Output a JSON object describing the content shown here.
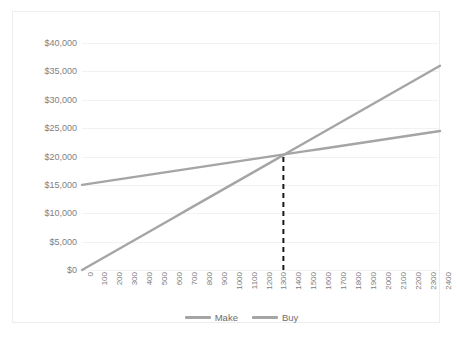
{
  "chart_data": {
    "type": "line",
    "title": "",
    "xlabel": "",
    "ylabel": "",
    "x": [
      0,
      100,
      200,
      300,
      400,
      500,
      600,
      700,
      800,
      900,
      1000,
      1100,
      1200,
      1300,
      1400,
      1500,
      1600,
      1700,
      1800,
      1900,
      2000,
      2100,
      2200,
      2300,
      2400
    ],
    "xtick_labels": [
      "0",
      "100",
      "200",
      "300",
      "400",
      "500",
      "600",
      "700",
      "800",
      "900",
      "1000",
      "1100",
      "1200",
      "1300",
      "1400",
      "1500",
      "1600",
      "1700",
      "1800",
      "1900",
      "2000",
      "2100",
      "2200",
      "2300",
      "2400"
    ],
    "ytick_labels": [
      "$0",
      "$5,000",
      "$10,000",
      "$15,000",
      "$20,000",
      "$25,000",
      "$30,000",
      "$35,000",
      "$40,000"
    ],
    "ytick_values": [
      0,
      5000,
      10000,
      15000,
      20000,
      25000,
      30000,
      35000,
      40000
    ],
    "xlim": [
      0,
      2400
    ],
    "ylim": [
      0,
      40000
    ],
    "grid": true,
    "legend_position": "bottom-center",
    "series": [
      {
        "name": "Make",
        "color": "#a5a5a5",
        "values": [
          0,
          1500,
          3000,
          4500,
          6000,
          7500,
          9000,
          10500,
          12000,
          13500,
          15000,
          16500,
          18000,
          19500,
          21000,
          22500,
          24000,
          25500,
          27000,
          28500,
          30000,
          31500,
          33000,
          34500,
          36000
        ]
      },
      {
        "name": "Buy",
        "color": "#a5a5a5",
        "values": [
          15000,
          15396,
          15792,
          16188,
          16583,
          16979,
          17375,
          17771,
          18167,
          18563,
          18958,
          19354,
          19750,
          20146,
          20542,
          20938,
          21333,
          21729,
          22125,
          22521,
          22917,
          23313,
          23708,
          24104,
          24500
        ]
      }
    ],
    "annotations": [
      {
        "type": "vertical-dashed-line",
        "name": "breakeven-marker",
        "x": 1350,
        "y_from": 0,
        "y_to": 20280,
        "color": "#1a1a1a"
      }
    ]
  },
  "legend": {
    "items": [
      {
        "label": "Make",
        "color": "#a5a5a5"
      },
      {
        "label": "Buy",
        "color": "#a5a5a5"
      }
    ]
  },
  "colors": {
    "grid": "#f2f2f2",
    "tick_text": "#808080",
    "border": "#ededed",
    "background": "#ffffff",
    "series_gray": "#a5a5a5",
    "breakeven": "#1a1a1a"
  }
}
